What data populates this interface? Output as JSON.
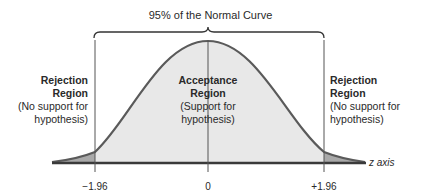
{
  "title": "95% of the Normal Curve",
  "regions": {
    "left": {
      "heading_1": "Rejection",
      "heading_2": "Region",
      "note_1": "(No support for",
      "note_2": "hypothesis)"
    },
    "center": {
      "heading_1": "Acceptance",
      "heading_2": "Region",
      "note_1": "(Support for",
      "note_2": "hypothesis)"
    },
    "right": {
      "heading_1": "Rejection",
      "heading_2": "Region",
      "note_1": "(No support for",
      "note_2": "hypothesis)"
    }
  },
  "axis": {
    "label": "z axis",
    "ticks": [
      "−1.96",
      "0",
      "+1.96"
    ]
  },
  "colors": {
    "curve": "#5a5a5a",
    "acceptance_fill": "#e8e8e8",
    "rejection_fill": "#a9a9a9",
    "axis": "#3a3a3a"
  }
}
